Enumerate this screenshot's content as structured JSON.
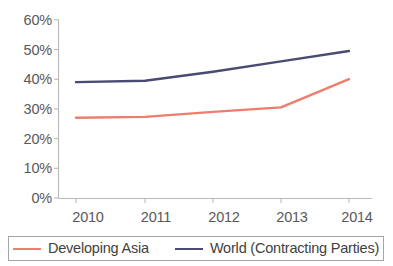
{
  "chart_data": {
    "type": "line",
    "title": "",
    "subtitle": "",
    "xlabel": "",
    "ylabel": "",
    "categories": [
      "2010",
      "2011",
      "2012",
      "2013",
      "2014"
    ],
    "x_tick_labels": [
      "2010",
      "2011",
      "2012",
      "2013",
      "2014"
    ],
    "y_tick_labels": [
      "0%",
      "10%",
      "20%",
      "30%",
      "40%",
      "50%",
      "60%"
    ],
    "y_tick_values": [
      0,
      10,
      20,
      30,
      40,
      50,
      60
    ],
    "ylim": [
      0,
      60
    ],
    "grid": false,
    "legend_position": "bottom",
    "series": [
      {
        "name": "Developing Asia",
        "color": "#ED7D6C",
        "values": [
          27,
          27.3,
          29,
          30.5,
          40
        ]
      },
      {
        "name": "World (Contracting Parties)",
        "color": "#4A4A73",
        "values": [
          39,
          39.5,
          42.5,
          46,
          49.5
        ]
      }
    ]
  },
  "legend": {
    "items": [
      {
        "label": "Developing Asia",
        "color": "#ED7D6C"
      },
      {
        "label": "World (Contracting Parties)",
        "color": "#4A4A73"
      }
    ]
  },
  "axes": {
    "axis_color": "#b9b9bb",
    "tick_text_color": "#59595b"
  }
}
